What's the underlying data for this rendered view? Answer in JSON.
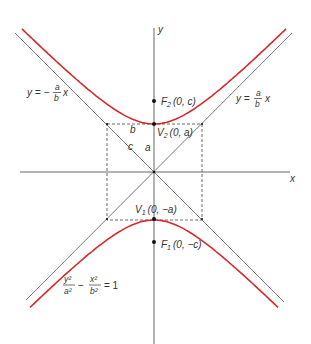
{
  "diagram": {
    "colors": {
      "curve": "#d42a2a",
      "axes": "#555555",
      "asymptotes": "#6b6b6b",
      "text": "#333333"
    },
    "geometry": {
      "center_px": [
        154,
        172
      ],
      "a_px": 48,
      "b_px": 47,
      "c_px": 70
    },
    "axes": {
      "x_label": "x",
      "y_label": "y"
    },
    "points": {
      "F2": {
        "name": "F",
        "sub": "2",
        "coords": "(0, c)"
      },
      "V2": {
        "name": "V",
        "sub": "2",
        "coords": "(0, a)"
      },
      "V1": {
        "name": "V",
        "sub": "1",
        "coords": "(0, −a)"
      },
      "F1": {
        "name": "F",
        "sub": "1",
        "coords": "(0, −c)"
      }
    },
    "segment_labels": {
      "b": "b",
      "a": "a",
      "c": "c"
    },
    "asymptotes": {
      "left": {
        "lhs": "y = −",
        "num": "a",
        "den": "b",
        "var": "x"
      },
      "right": {
        "lhs": "y =",
        "num": "a",
        "den": "b",
        "var": "x"
      }
    },
    "equation": {
      "t1_num": "y²",
      "t1_den": "a²",
      "minus": "−",
      "t2_num": "x²",
      "t2_den": "b²",
      "rhs": "= 1"
    }
  }
}
